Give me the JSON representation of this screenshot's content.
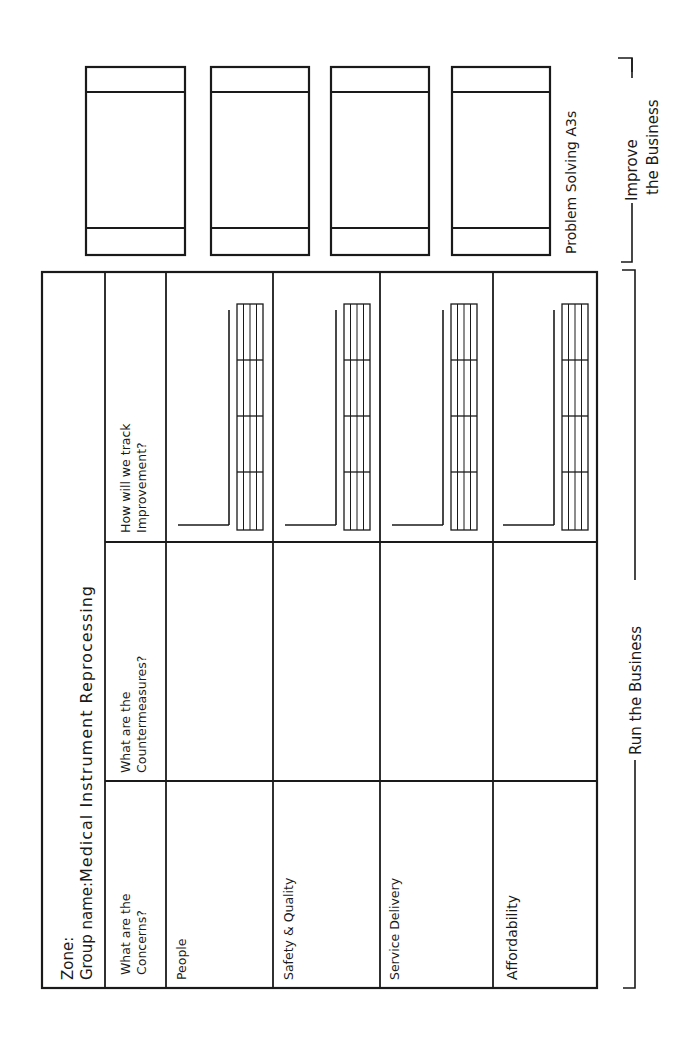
{
  "board": {
    "zone_label": "Zone:",
    "group_label": "Group name:",
    "group_name": "Medical Instrument Reprocessing",
    "columns": [
      {
        "line1": "What are the",
        "line2": "Concerns?"
      },
      {
        "line1": "What are the",
        "line2": "Countermeasures?"
      },
      {
        "line1": "How will we track",
        "line2": "Improvement?"
      }
    ],
    "rows": [
      {
        "label": "People"
      },
      {
        "label": "Safety & Quality"
      },
      {
        "label": "Service Delivery"
      },
      {
        "label": "Affordability"
      }
    ]
  },
  "sections": {
    "run": "Run the Business",
    "improve_line1": "Improve",
    "improve_line2": "the Business",
    "a3_label": "Problem Solving A3s"
  },
  "a3_boxes": [
    {
      "index": 1
    },
    {
      "index": 2
    },
    {
      "index": 3
    },
    {
      "index": 4
    }
  ],
  "colors": {
    "ink": "#1a1a1a",
    "paper": "#ffffff"
  }
}
